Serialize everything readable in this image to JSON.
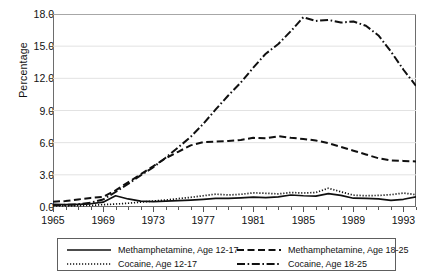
{
  "chart_data": {
    "type": "line",
    "title": "",
    "xlabel": "",
    "ylabel": "Percentage",
    "xlim": [
      1965,
      1994
    ],
    "ylim": [
      0.0,
      18.0
    ],
    "grid": true,
    "legend_position": "below-plot",
    "x": [
      1965,
      1966,
      1967,
      1968,
      1969,
      1970,
      1971,
      1972,
      1973,
      1974,
      1975,
      1976,
      1977,
      1978,
      1979,
      1980,
      1981,
      1982,
      1983,
      1984,
      1985,
      1986,
      1987,
      1988,
      1989,
      1990,
      1991,
      1992,
      1993,
      1994
    ],
    "xticks": [
      1965,
      1969,
      1973,
      1977,
      1981,
      1985,
      1989,
      1993
    ],
    "xtick_labels": [
      "1965",
      "1969",
      "1973",
      "1977",
      "1981",
      "1985",
      "1989",
      "1993"
    ],
    "yticks": [
      0.0,
      3.0,
      6.0,
      9.0,
      12.0,
      15.0,
      18.0
    ],
    "ytick_labels": [
      "0.0",
      "3.0",
      "6.0",
      "9.0",
      "12.0",
      "15.0",
      "18.0"
    ],
    "series": [
      {
        "name": "Methamphetamine, Age 12-17",
        "style": "solid",
        "color": "#101010",
        "values": [
          0.25,
          0.22,
          0.25,
          0.3,
          0.45,
          1.05,
          0.75,
          0.55,
          0.5,
          0.55,
          0.6,
          0.65,
          0.72,
          0.8,
          0.8,
          0.85,
          0.92,
          0.88,
          0.95,
          1.12,
          1.05,
          1.02,
          1.25,
          1.08,
          0.82,
          0.8,
          0.75,
          0.62,
          0.72,
          0.95
        ]
      },
      {
        "name": "Methamphetamine, Age 18-25",
        "style": "dashed",
        "color": "#101010",
        "values": [
          0.5,
          0.55,
          0.7,
          0.85,
          0.95,
          1.55,
          2.3,
          3.05,
          3.8,
          4.55,
          5.15,
          5.75,
          6.05,
          6.1,
          6.15,
          6.25,
          6.45,
          6.4,
          6.6,
          6.45,
          6.35,
          6.2,
          5.95,
          5.6,
          5.25,
          4.9,
          4.55,
          4.35,
          4.3,
          4.25
        ]
      },
      {
        "name": "Cocaine, Age 12-17",
        "style": "dotted",
        "color": "#101010",
        "values": [
          0.1,
          0.1,
          0.12,
          0.15,
          0.22,
          0.28,
          0.35,
          0.45,
          0.55,
          0.65,
          0.78,
          0.9,
          1.05,
          1.2,
          1.12,
          1.18,
          1.32,
          1.28,
          1.22,
          1.35,
          1.3,
          1.35,
          1.75,
          1.42,
          1.1,
          1.05,
          1.08,
          1.15,
          1.3,
          1.15
        ]
      },
      {
        "name": "Cocaine, Age 18-25",
        "style": "dashdot",
        "color": "#101010",
        "values": [
          0.18,
          0.2,
          0.25,
          0.4,
          0.7,
          1.4,
          2.15,
          2.95,
          3.7,
          4.6,
          5.55,
          6.55,
          7.75,
          9.1,
          10.4,
          11.6,
          13.0,
          14.3,
          15.2,
          16.4,
          17.7,
          17.35,
          17.45,
          17.2,
          17.3,
          16.9,
          16.0,
          14.5,
          12.8,
          11.3
        ]
      }
    ]
  },
  "legend": {
    "entries": [
      {
        "label": "Methamphetamine, Age 12-17",
        "style": "solid"
      },
      {
        "label": "Methamphetamine, Age 18-25",
        "style": "dashed"
      },
      {
        "label": "Cocaine, Age 12-17",
        "style": "dotted"
      },
      {
        "label": "Cocaine, Age 18-25",
        "style": "dashdot"
      }
    ]
  }
}
